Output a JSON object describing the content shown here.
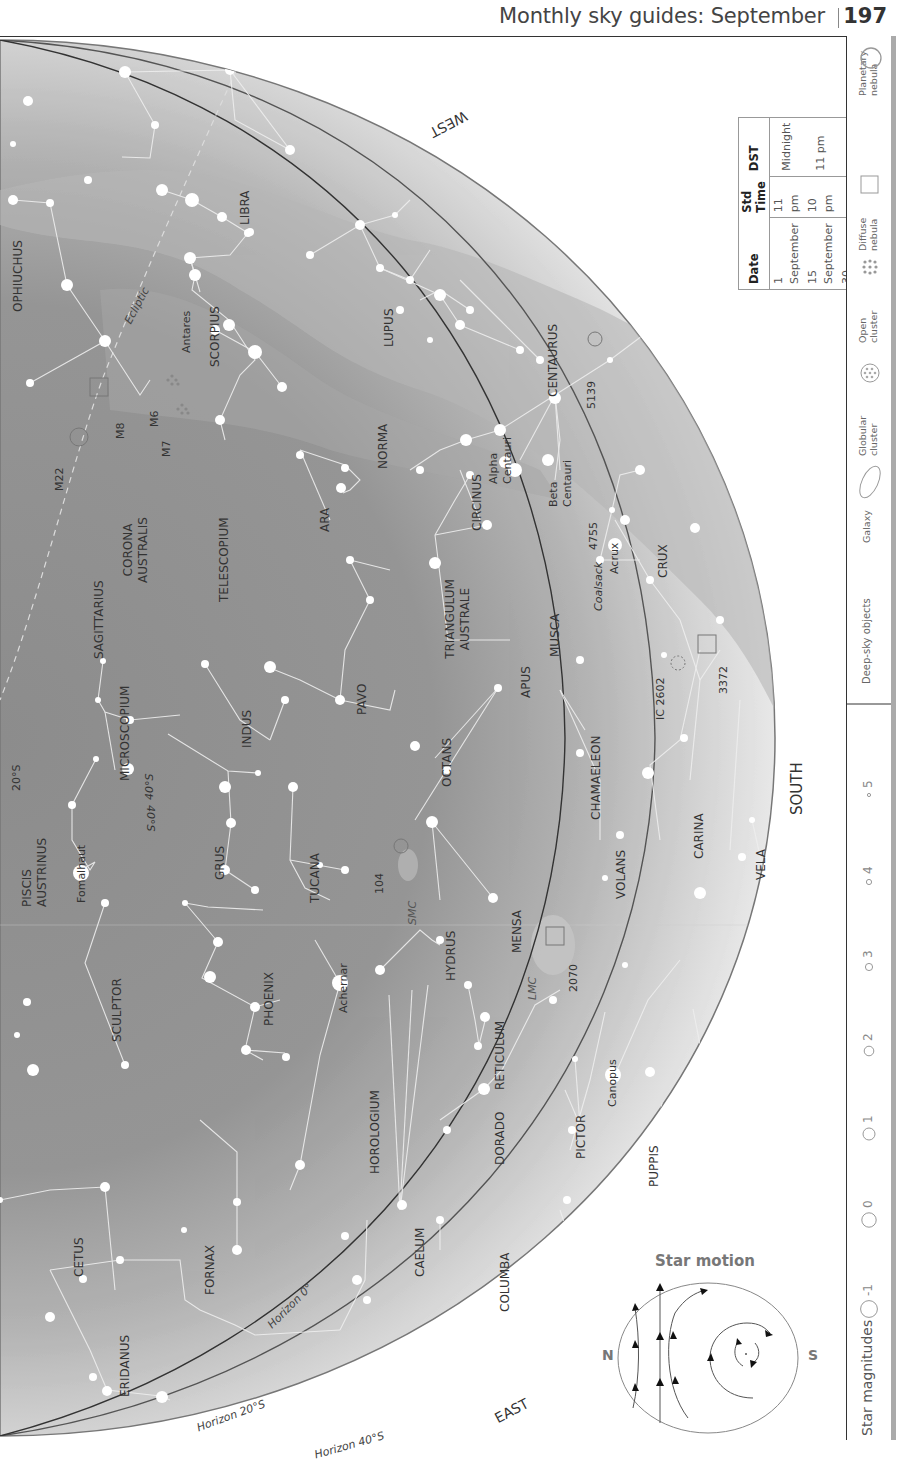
{
  "header": {
    "title": "Monthly sky guides: September",
    "page_number": "197"
  },
  "map": {
    "directions": {
      "west": "WEST",
      "south": "SOUTH",
      "east": "EAST"
    },
    "horizons": [
      "Horizon 0°",
      "Horizon 20°S",
      "Horizon 40°S"
    ],
    "ecliptic_label": "Ecliptic",
    "latitude_markers": [
      "20°S",
      "40°S",
      "40°S"
    ],
    "constellations": [
      "OPHIUCHUS",
      "LIBRA",
      "SCORPIUS",
      "LUPUS",
      "CENTAURUS",
      "NORMA",
      "CIRCINUS",
      "ARA",
      "CORONA AUSTRALIS",
      "TELESCOPIUM",
      "SAGITTARIUS",
      "TRIANGULUM AUSTRALE",
      "MUSCA",
      "CRUX",
      "APUS",
      "PAVO",
      "INDUS",
      "MICROSCOPIUM",
      "OCTANS",
      "CHAMAELEON",
      "PISCIS AUSTRINUS",
      "GRUS",
      "TUCANA",
      "HYDRUS",
      "MENSA",
      "VOLANS",
      "CARINA",
      "VELA",
      "SCULPTOR",
      "PHOENIX",
      "RETICULUM",
      "HOROLOGIUM",
      "DORADO",
      "PICTOR",
      "PUPPIS",
      "CETUS",
      "FORNAX",
      "CAELUM",
      "COLUMBA",
      "ERIDANUS"
    ],
    "named_stars": [
      "Antares",
      "Alpha Centauri",
      "Beta Centauri",
      "Acrux",
      "Fomalhaut",
      "Achernar",
      "Canopus"
    ],
    "deep_sky_objects": [
      "M22",
      "M8",
      "M6",
      "M7",
      "5139",
      "4755",
      "Coalsack",
      "IC 2602",
      "3372",
      "104",
      "SMC",
      "LMC",
      "2070"
    ]
  },
  "time_table": {
    "headers": [
      "Date",
      "Std Time",
      "DST"
    ],
    "rows": [
      [
        "1 September",
        "11 pm",
        "Midnight"
      ],
      [
        "15 September",
        "10 pm",
        "11 pm"
      ],
      [
        "30 September",
        "9 pm",
        "10 pm"
      ]
    ]
  },
  "star_motion": {
    "title": "Star motion",
    "left_label": "N",
    "right_label": "S"
  },
  "legend": {
    "deep_sky_title": "Deep-sky objects",
    "deep_sky_items": [
      {
        "label": "Galaxy",
        "icon": "galaxy-icon"
      },
      {
        "label": "Globular cluster",
        "icon": "globular-cluster-icon"
      },
      {
        "label": "Open cluster",
        "icon": "open-cluster-icon"
      },
      {
        "label": "Diffuse nebula",
        "icon": "diffuse-nebula-icon"
      },
      {
        "label": "Planetary nebula",
        "icon": "planetary-nebula-icon"
      }
    ],
    "magnitudes_title": "Star magnitudes",
    "magnitudes": [
      "-1",
      "0",
      "1",
      "2",
      "3",
      "4",
      "5"
    ]
  }
}
